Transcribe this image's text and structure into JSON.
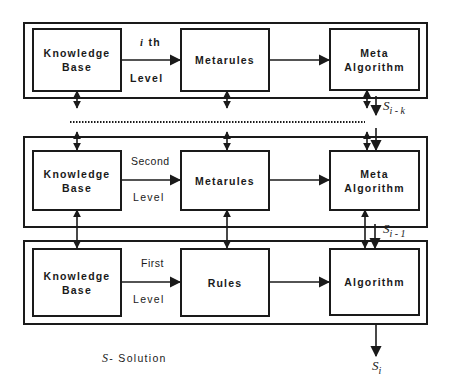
{
  "levels": [
    {
      "id": "ith",
      "level_top_label": "i th",
      "level_bottom_label": "Level",
      "knowledge_base": "Knowledge Base",
      "middle": "Metarules",
      "algorithm": "Meta Algorithm"
    },
    {
      "id": "second",
      "level_top_label": "Second",
      "level_bottom_label": "Level",
      "knowledge_base": "Knowledge Base",
      "middle": "Metarules",
      "algorithm": "Meta Algorithm"
    },
    {
      "id": "first",
      "level_top_label": "First",
      "level_bottom_label": "Level",
      "knowledge_base": "Knowledge Base",
      "middle": "Rules",
      "algorithm": "Algorithm"
    }
  ],
  "solutions": {
    "s_i_minus_k": {
      "base": "S",
      "sub": "i - k"
    },
    "s_i_minus_1": {
      "base": "S",
      "sub": "i - 1"
    },
    "s_i": {
      "base": "S",
      "sub": "i"
    }
  },
  "legend": {
    "symbol": "S",
    "text": "- Solution"
  },
  "colors": {
    "stroke": "#1a1a1a",
    "background": "#ffffff"
  }
}
